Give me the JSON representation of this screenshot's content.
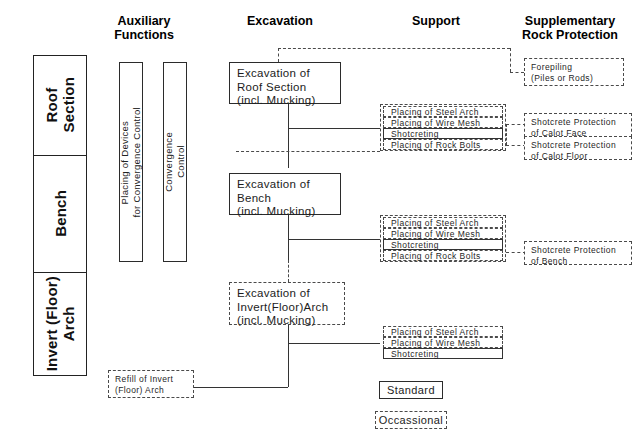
{
  "headers": {
    "auxiliary": "Auxiliary\nFunctions",
    "auxiliary_l1": "Auxiliary",
    "auxiliary_l2": "Functions",
    "excavation": "Excavation",
    "support": "Support",
    "supplementary_l1": "Supplementary",
    "supplementary_l2": "Rock Protection"
  },
  "sections": [
    {
      "label": "Roof\nSection",
      "label_plain": "Roof Section"
    },
    {
      "label": "Bench",
      "label_plain": "Bench"
    },
    {
      "label": "Invert (Floor)\nArch",
      "label_plain": "Invert (Floor) Arch"
    }
  ],
  "auxiliary_functions": [
    {
      "label": "Placing of Devices\nfor Convergence Control"
    },
    {
      "label": "Convergence\nControl"
    }
  ],
  "excavation": [
    {
      "l1": "Excavation of",
      "l2": "Roof Section",
      "l3": "(incl. Mucking)",
      "style": "solid"
    },
    {
      "l1": "Excavation of",
      "l2": "Bench",
      "l3": "(incl. Mucking)",
      "style": "solid"
    },
    {
      "l1": "Excavation of",
      "l2": "Invert(Floor)Arch",
      "l3": "(incl. Mucking)",
      "style": "dash"
    }
  ],
  "refill": {
    "l1": "Refill of Invert",
    "l2": "(Floor) Arch",
    "style": "dash"
  },
  "support_groups": [
    {
      "name": "roof-support",
      "rows": [
        {
          "label": "Placing of Steel Arch",
          "style": "dash"
        },
        {
          "label": "Placing of Wire Mesh",
          "style": "dash"
        },
        {
          "label": "Shotcreting",
          "style": "solid"
        },
        {
          "label": "Placing of Rock Bolts",
          "style": "dash"
        }
      ]
    },
    {
      "name": "bench-support",
      "rows": [
        {
          "label": "Placing of Steel Arch",
          "style": "dash"
        },
        {
          "label": "Placing of Wire Mesh",
          "style": "dash"
        },
        {
          "label": "Shotcreting",
          "style": "solid"
        },
        {
          "label": "Placing of Rock Bolts",
          "style": "dash"
        }
      ]
    },
    {
      "name": "invert-support",
      "rows": [
        {
          "label": "Placing of Steel Arch",
          "style": "dash"
        },
        {
          "label": "Placing of Wire Mesh",
          "style": "dash"
        },
        {
          "label": "Shotcreting",
          "style": "solid"
        }
      ]
    }
  ],
  "rock_protection": [
    {
      "l1": "Forepiling",
      "l2": "(Piles or Rods)"
    },
    {
      "l1": "Shotcrete Protection",
      "l2": "of Calot Face"
    },
    {
      "l1": "Shotcrete Protection",
      "l2": "of Calot Floor"
    },
    {
      "l1": "Shotcrete Protection",
      "l2": "of Bench"
    }
  ],
  "legend": [
    {
      "label": "Standard",
      "style": "solid"
    },
    {
      "label": "Occassional",
      "style": "dash"
    }
  ],
  "colors": {
    "line": "#333333",
    "dashed": "#4a4a4a",
    "text": "#1c1c1c",
    "background": "#ffffff"
  }
}
